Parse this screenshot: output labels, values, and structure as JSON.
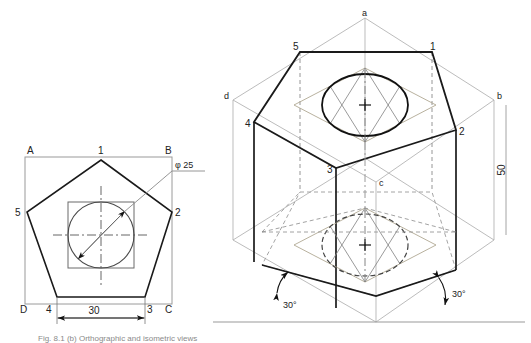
{
  "figure": {
    "caption": "Fig. 8.1 (b) Orthographic and isometric views"
  },
  "orthographic_view": {
    "name": "top-view-pentagon-in-square",
    "square_corner_labels": {
      "top_left": "A",
      "top_right": "B",
      "bottom_right": "C",
      "bottom_left": "D"
    },
    "pentagon_vertex_labels": {
      "apex": "1",
      "right": "2",
      "bottom_right": "3",
      "bottom_left": "4",
      "left": "5"
    },
    "dimensions": [
      {
        "name": "hole-diameter",
        "text": "φ 25",
        "value": 25,
        "symbol": "φ"
      },
      {
        "name": "base-width",
        "text": "30",
        "value": 30
      }
    ]
  },
  "isometric_view": {
    "name": "isometric-pentagonal-prism",
    "box_corner_labels": {
      "back": "a",
      "right": "b",
      "front": "c",
      "left": "d"
    },
    "top_pentagon_vertex_labels": {
      "left": "5",
      "right": "1",
      "far_left": "4",
      "far_right": "2",
      "front": "3"
    },
    "dimensions": [
      {
        "name": "prism-height",
        "text": "50",
        "value": 50,
        "orientation": "vertical"
      },
      {
        "name": "left-iso-angle",
        "text": "30°",
        "value": 30
      },
      {
        "name": "right-iso-angle",
        "text": "30°",
        "value": 30
      }
    ],
    "features": [
      {
        "name": "top-face-ellipse",
        "style": "visible"
      },
      {
        "name": "bottom-face-ellipse",
        "style": "hidden-dashed"
      },
      {
        "name": "four-center-construction-rhombus",
        "style": "construction"
      }
    ]
  },
  "colors": {
    "outline": "#1a1a1a",
    "construction": "#9a9a9a",
    "hidden": "#555555",
    "text": "#222222"
  }
}
